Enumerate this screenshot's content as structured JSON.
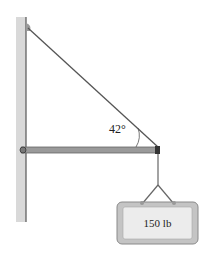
{
  "diagram": {
    "angle_label": "42°",
    "load_label": "150 lb",
    "elements": [
      "wall",
      "cable",
      "boom",
      "pin-support",
      "hanger-chain",
      "hanging-sign"
    ]
  },
  "colors": {
    "wall": "#d9d9d9",
    "wall_edge": "#555555",
    "cable": "#555555",
    "boom": "#8c8c8c",
    "sign_frame": "#bdbdbd",
    "sign_face": "#ececec"
  }
}
